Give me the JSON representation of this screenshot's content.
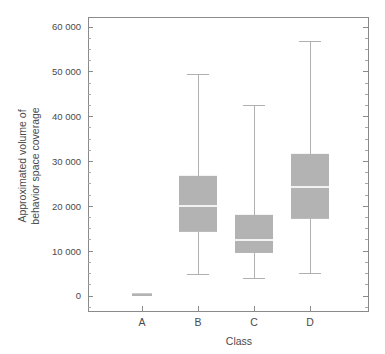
{
  "chart_data": {
    "type": "box",
    "title": "",
    "xlabel": "Class",
    "ylabel": "Approximated volume of behavior space coverage",
    "ylabel_line1": "Approximated volume of",
    "ylabel_line2": "behavior space coverage",
    "categories": [
      "A",
      "B",
      "C",
      "D"
    ],
    "ylim": [
      -3000,
      62000
    ],
    "ytick_values": [
      0,
      10000,
      20000,
      30000,
      40000,
      50000,
      60000
    ],
    "ytick_labels": [
      "0",
      "10 000",
      "20 000",
      "30 000",
      "40 000",
      "50 000",
      "60 000"
    ],
    "yminor_step": 2500,
    "grid": false,
    "legend": null,
    "box_color": "#b3b3b3",
    "median_color": "#f2f2f2",
    "whisker_color": "#b0b0b0",
    "axis_color": "#8a8a8a",
    "boxes": [
      {
        "category": "A",
        "whisker_low": 0,
        "q1": 0,
        "median": 250,
        "q3": 600,
        "whisker_high": 600
      },
      {
        "category": "B",
        "whisker_low": 4700,
        "q1": 14300,
        "median": 20100,
        "q3": 26800,
        "whisker_high": 49300
      },
      {
        "category": "C",
        "whisker_low": 3800,
        "q1": 9600,
        "median": 12500,
        "q3": 18100,
        "whisker_high": 42600
      },
      {
        "category": "D",
        "whisker_low": 5100,
        "q1": 17200,
        "median": 24300,
        "q3": 31700,
        "whisker_high": 56700
      }
    ]
  }
}
